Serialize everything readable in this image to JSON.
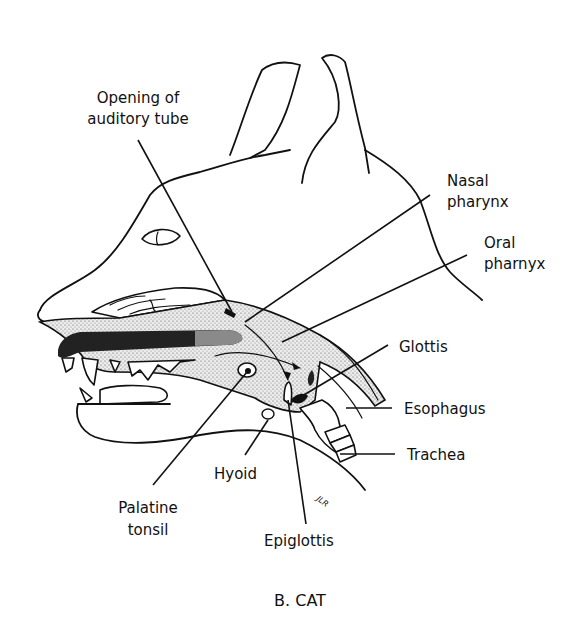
{
  "figure": {
    "caption": "B. CAT",
    "signature": "JLR",
    "colors": {
      "background": "#ffffff",
      "ink": "#111111",
      "tongue_dark": "#222222",
      "tongue_light": "#8a8a8a",
      "stipple": "#555555"
    }
  },
  "labels": [
    {
      "id": "opening-auditory-tube",
      "lines": [
        "Opening of",
        "auditory tube"
      ]
    },
    {
      "id": "nasal-pharynx",
      "lines": [
        "Nasal",
        "pharynx"
      ]
    },
    {
      "id": "oral-pharynx",
      "lines": [
        "Oral",
        "pharnyx"
      ]
    },
    {
      "id": "glottis",
      "lines": [
        "Glottis"
      ]
    },
    {
      "id": "esophagus",
      "lines": [
        "Esophagus"
      ]
    },
    {
      "id": "trachea",
      "lines": [
        "Trachea"
      ]
    },
    {
      "id": "hyoid",
      "lines": [
        "Hyoid"
      ]
    },
    {
      "id": "palatine-tonsil",
      "lines": [
        "Palatine",
        "tonsil"
      ]
    },
    {
      "id": "epiglottis",
      "lines": [
        "Epiglottis"
      ]
    }
  ]
}
